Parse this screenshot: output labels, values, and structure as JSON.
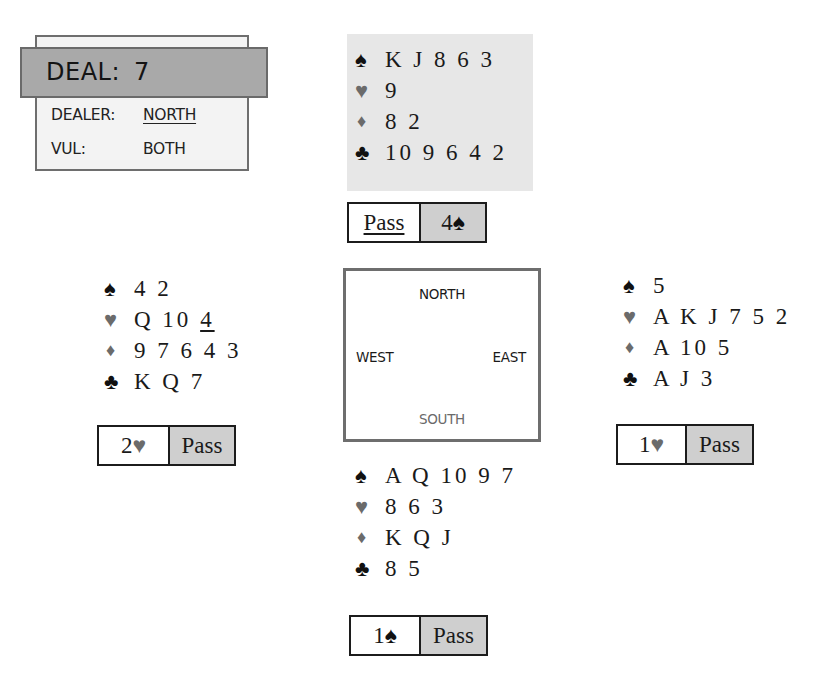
{
  "deal": {
    "title_label": "DEAL:",
    "number": "7",
    "dealer_label": "DEALER:",
    "dealer_value": "NORTH",
    "vul_label": "VUL:",
    "vul_value": "BOTH"
  },
  "suits": {
    "spades": "♠",
    "hearts": "♥",
    "diamonds": "♦",
    "clubs": "♣"
  },
  "colors": {
    "black_suit": "#111111",
    "red_suit": "#6b6b6b",
    "north_highlight": "#e7e7e7",
    "bid_shaded": "#cfcfcf",
    "deal_banner": "#a9a9a9"
  },
  "hands": {
    "north": {
      "spades": "K J 8 6 3",
      "hearts": "9",
      "diamonds": "8 2",
      "clubs": "10 9 6 4 2"
    },
    "west": {
      "spades": "4 2",
      "hearts_prefix": "Q 10 ",
      "hearts_underlined": "4",
      "diamonds": "9 7 6 4 3",
      "clubs": "K Q 7"
    },
    "east": {
      "spades": "5",
      "hearts": "A K J 7 5 2",
      "diamonds": "A 10 5",
      "clubs": "A J 3"
    },
    "south": {
      "spades": "A Q 10 9 7",
      "hearts": "8 6 3",
      "diamonds": "K Q J",
      "clubs": "8 5"
    }
  },
  "bids": {
    "north": {
      "first": "Pass",
      "second_level": "4",
      "second_suit": "♠"
    },
    "west": {
      "first_level": "2",
      "first_suit": "♥",
      "second": "Pass"
    },
    "east": {
      "first_level": "1",
      "first_suit": "♥",
      "second": "Pass"
    },
    "south": {
      "first_level": "1",
      "first_suit": "♠",
      "second": "Pass"
    }
  },
  "compass": {
    "north": "NORTH",
    "west": "WEST",
    "east": "EAST",
    "south": "SOUTH"
  }
}
